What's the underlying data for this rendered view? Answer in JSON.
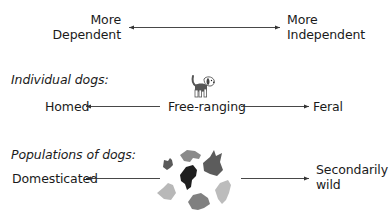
{
  "top_scale": {
    "left_label": [
      "More",
      "Dependent"
    ],
    "right_label": [
      "More",
      "Independent"
    ],
    "arrow": "bidirectional"
  },
  "individual_dogs": {
    "heading": "Individual dogs:",
    "left": "Homed",
    "center": "Free-ranging",
    "right": "Feral",
    "center_icon": "dog-icon"
  },
  "populations_of_dogs": {
    "heading": "Populations of dogs:",
    "left": "Domesticated",
    "right": [
      "Secondarily",
      "wild"
    ],
    "center_icon": "dog-heads-cluster-icon"
  },
  "colors": {
    "text": "#1a1a1a",
    "arrow": "#333333",
    "head_dark": "#1f1f1f",
    "head_mid": "#6e6e6e",
    "head_light": "#b5b5b5"
  }
}
